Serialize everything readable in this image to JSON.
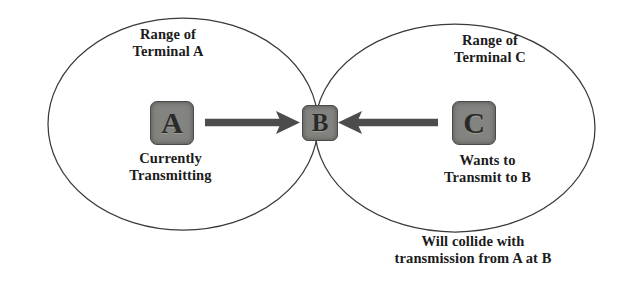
{
  "diagram": {
    "background_color": "#ffffff",
    "stroke_color": "#3a3a3a",
    "node_fill_color": "#83837f",
    "node_border_color": "#4a4a48",
    "text_color": "#1b1b1b",
    "arrow_color": "#4c4c4c"
  },
  "ranges": {
    "a": {
      "label": "Range of\nTerminal A",
      "cx": 183,
      "cy": 124,
      "rx": 135,
      "ry": 106
    },
    "c": {
      "label": "Range of\nTerminal C",
      "cx": 455,
      "cy": 128,
      "rx": 140,
      "ry": 104
    }
  },
  "nodes": [
    {
      "id": "a",
      "label": "A",
      "status": "Currently\nTransmitting"
    },
    {
      "id": "b",
      "label": "B",
      "status": ""
    },
    {
      "id": "c",
      "label": "C",
      "status": "Wants to\nTransmit to B"
    }
  ],
  "arrows": [
    {
      "id": "a-to-b",
      "from": "A",
      "to": "B",
      "direction": "right"
    },
    {
      "id": "c-to-b",
      "from": "C",
      "to": "B",
      "direction": "left"
    }
  ],
  "caption": {
    "collision": "Will collide with\ntransmission from A at B"
  }
}
